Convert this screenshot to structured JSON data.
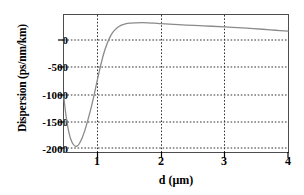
{
  "chart_data": {
    "type": "line",
    "title": "",
    "xlabel": "d (μm)",
    "ylabel": "Dispersion (ps/nm/km)",
    "xlim": [
      0.47,
      4.0
    ],
    "ylim": [
      -2100,
      400
    ],
    "xticks": [
      1,
      2,
      3,
      4
    ],
    "xtick_labels": [
      "1",
      "2",
      "3",
      "4"
    ],
    "yticks": [
      0,
      -500,
      -1000,
      -1500,
      -2000
    ],
    "ytick_labels": [
      "0",
      "-500",
      "-1000",
      "-1500",
      "-2000"
    ],
    "grid": true,
    "grid_style": "dotted",
    "legend": null,
    "line_color": "#808080",
    "series": [
      {
        "name": "dispersion",
        "x": [
          0.47,
          0.5,
          0.55,
          0.6,
          0.65,
          0.69,
          0.72,
          0.76,
          0.8,
          0.85,
          0.9,
          0.95,
          1.0,
          1.05,
          1.1,
          1.15,
          1.2,
          1.25,
          1.3,
          1.35,
          1.4,
          1.5,
          1.6,
          1.7,
          1.8,
          1.9,
          2.0,
          2.2,
          2.4,
          2.6,
          2.8,
          3.0,
          3.2,
          3.4,
          3.6,
          3.8,
          4.0
        ],
        "y": [
          -1120,
          -1420,
          -1760,
          -1930,
          -1995,
          -1980,
          -1930,
          -1830,
          -1700,
          -1500,
          -1280,
          -1030,
          -760,
          -510,
          -290,
          -120,
          10,
          100,
          160,
          200,
          225,
          250,
          258,
          260,
          258,
          252,
          243,
          228,
          215,
          205,
          195,
          183,
          170,
          155,
          140,
          122,
          105
        ]
      }
    ],
    "annotations": []
  },
  "figure": {
    "x_axis_title": "d (μm)",
    "y_axis_title": "Dispersion (ps/nm/km)"
  }
}
